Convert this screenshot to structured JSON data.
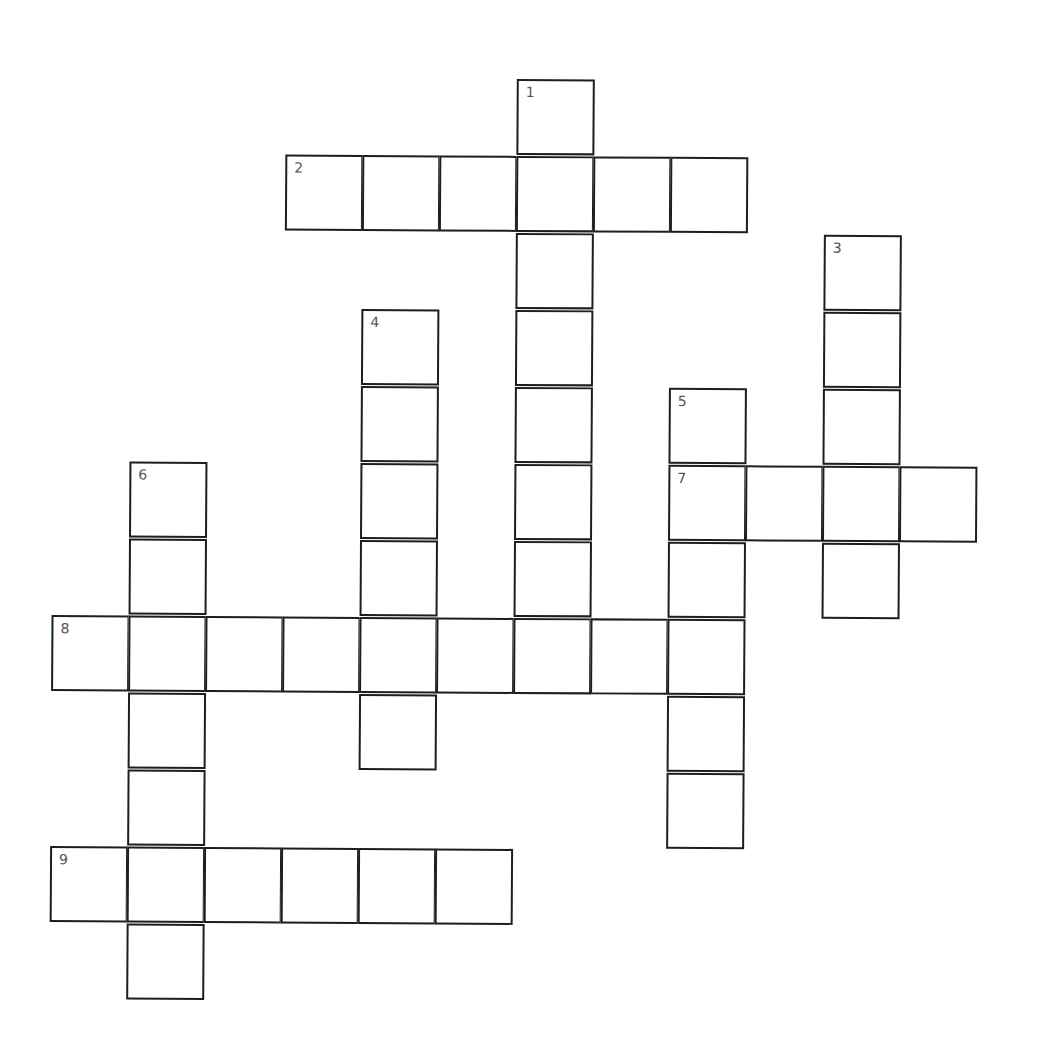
{
  "puzzle": {
    "type": "crossword",
    "cell_size_px": 77,
    "origin_px": [
      53,
      80
    ],
    "colors": {
      "line": "#1e1e1e",
      "background": "#ffffff",
      "number": "#555555"
    },
    "clues": {
      "across": [
        {
          "number": 2,
          "row": 1,
          "col": 3,
          "length": 6
        },
        {
          "number": 7,
          "row": 5,
          "col": 8,
          "length": 4
        },
        {
          "number": 8,
          "row": 7,
          "col": 0,
          "length": 9
        },
        {
          "number": 9,
          "row": 10,
          "col": 0,
          "length": 6
        }
      ],
      "down": [
        {
          "number": 1,
          "row": 0,
          "col": 6,
          "length": 8
        },
        {
          "number": 3,
          "row": 2,
          "col": 10,
          "length": 5
        },
        {
          "number": 4,
          "row": 3,
          "col": 4,
          "length": 6
        },
        {
          "number": 5,
          "row": 4,
          "col": 8,
          "length": 6
        },
        {
          "number": 6,
          "row": 5,
          "col": 1,
          "length": 7
        }
      ]
    },
    "numbers": [
      {
        "label": "1",
        "row": 0,
        "col": 6
      },
      {
        "label": "2",
        "row": 1,
        "col": 3
      },
      {
        "label": "3",
        "row": 2,
        "col": 10
      },
      {
        "label": "4",
        "row": 3,
        "col": 4
      },
      {
        "label": "5",
        "row": 4,
        "col": 8
      },
      {
        "label": "6",
        "row": 5,
        "col": 1
      },
      {
        "label": "7",
        "row": 5,
        "col": 8
      },
      {
        "label": "8",
        "row": 7,
        "col": 0
      },
      {
        "label": "9",
        "row": 10,
        "col": 0
      }
    ]
  }
}
